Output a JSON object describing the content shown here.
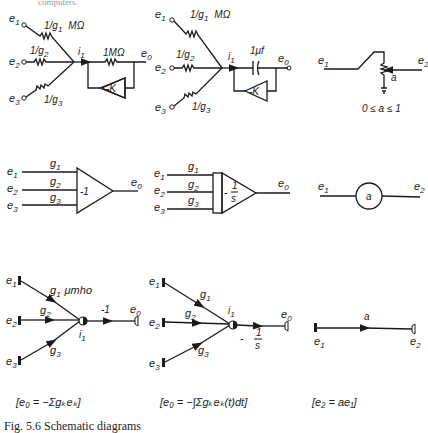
{
  "header": {
    "text": "...computers."
  },
  "figure": {
    "caption": "Fig. 5.6  Schematic diagrams",
    "rows": [
      {
        "name": "circuit-diagrams",
        "panels": [
          {
            "name": "summing-amplifier-circuit",
            "inputs": [
              "e1",
              "e2",
              "e3"
            ],
            "resistors": [
              "1/g1 MΩ",
              "1/g2",
              "1/g3"
            ],
            "current": "i1",
            "feedback": "1MΩ",
            "amplifier_gain": "-K",
            "output": "e0"
          },
          {
            "name": "integrator-circuit",
            "inputs": [
              "e1",
              "e2",
              "e3"
            ],
            "resistors": [
              "1/g1 MΩ",
              "1/g2",
              "1/g3"
            ],
            "current": "i1",
            "feedback": "1μf",
            "amplifier_gain": "-K",
            "output": "e0"
          },
          {
            "name": "potentiometer-circuit",
            "input": "e1",
            "output": "e2",
            "setting": "a",
            "range": "0 ≤ a ≤ 1"
          }
        ]
      },
      {
        "name": "block-diagrams",
        "panels": [
          {
            "name": "summer-block",
            "inputs": [
              "e1",
              "e2",
              "e3"
            ],
            "gains": [
              "g1",
              "g2",
              "g3"
            ],
            "block_label": "-1",
            "output": "e0"
          },
          {
            "name": "integrator-block",
            "inputs": [
              "e1",
              "e2",
              "e3"
            ],
            "gains": [
              "g1",
              "g2",
              "g3"
            ],
            "block_label_num": "1",
            "block_label_den": "s",
            "block_label_sign": "-",
            "output": "e0"
          },
          {
            "name": "coefficient-block",
            "input": "e1",
            "coefficient": "a",
            "output": "e2"
          }
        ]
      },
      {
        "name": "signal-flow-graphs",
        "panels": [
          {
            "name": "summer-flow-graph",
            "inputs": [
              "e1",
              "e2",
              "e3"
            ],
            "branch_gains": [
              "g1 μmho",
              "g2",
              "g3"
            ],
            "node": "i1",
            "output_gain": "-1",
            "output": "e0",
            "equation": "e0 = -Σ gk ek"
          },
          {
            "name": "integrator-flow-graph",
            "inputs": [
              "e1",
              "e2",
              "e3"
            ],
            "branch_gains": [
              "g1",
              "g2",
              "g3"
            ],
            "node": "i1",
            "output_gain_sign": "-",
            "output_gain_num": "1",
            "output_gain_den": "s",
            "output": "e0",
            "equation": "e0 = -∫Σ gk ek(t) dt"
          },
          {
            "name": "coefficient-flow-graph",
            "input": "e1",
            "branch_gain": "a",
            "output": "e2",
            "equation": "e2 = a e1"
          }
        ]
      }
    ]
  },
  "text": {
    "e1": "e",
    "e2": "e",
    "e3": "e",
    "e0": "e",
    "s1": "1",
    "s2": "2",
    "s3": "3",
    "s0": "0",
    "g": "g",
    "i": "i",
    "r1": "1/g",
    "mohm": "MΩ",
    "onemohm": "1MΩ",
    "mk": "-K",
    "muf": "1μf",
    "a": "a",
    "range": "0 ≤ a ≤ 1",
    "minus1": "-1",
    "one": "1",
    "s": "s",
    "minus": "-",
    "umho": "μmho",
    "k": "k",
    "eq1": "[e₀ = −Σgₖeₖ]",
    "eq2": "[e₀ = −∫Σgₖeₖ(t)dt]",
    "eq3": "[e₂ = ae₁]",
    "caption": "Fig. 5.6   Schematic diagrams",
    "header": "computers."
  }
}
